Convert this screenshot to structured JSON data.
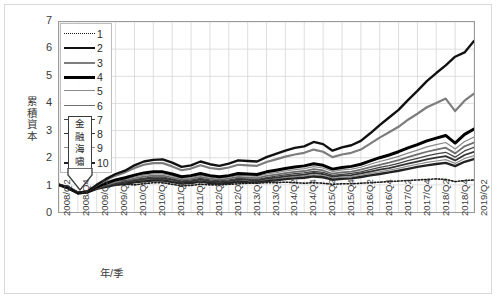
{
  "chart_data": {
    "type": "line",
    "title": "",
    "xlabel": "年/季",
    "ylabel": "累積資本",
    "ylim": [
      0,
      7
    ],
    "ytick_step": 1,
    "yticks": [
      "0",
      "1",
      "2",
      "3",
      "4",
      "5",
      "6",
      "7"
    ],
    "grid": true,
    "legend_position": "inside-top-left",
    "legend_entries": [
      "1",
      "2",
      "3",
      "4",
      "5",
      "6",
      "7",
      "8",
      "9",
      "10"
    ],
    "annotation": {
      "text": "金融海嘯",
      "chars": [
        "金",
        "融",
        "海",
        "嘯"
      ],
      "shape": "down-arrow-box",
      "at_x": "2008/Q4"
    },
    "categories": [
      "2008/Q2",
      "2008/Q3",
      "2008/Q4",
      "2009/Q1",
      "2009/Q2",
      "2009/Q3",
      "2009/Q4",
      "2010/Q1",
      "2010/Q2",
      "2010/Q3",
      "2010/Q4",
      "2011/Q1",
      "2011/Q2",
      "2011/Q3",
      "2011/Q4",
      "2012/Q1",
      "2012/Q2",
      "2012/Q3",
      "2012/Q4",
      "2013/Q1",
      "2013/Q2",
      "2013/Q3",
      "2013/Q4",
      "2014/Q1",
      "2014/Q2",
      "2014/Q3",
      "2014/Q4",
      "2015/Q1",
      "2015/Q2",
      "2015/Q3",
      "2015/Q4",
      "2016/Q1",
      "2016/Q2",
      "2016/Q3",
      "2016/Q4",
      "2017/Q1",
      "2017/Q2",
      "2017/Q3",
      "2017/Q4",
      "2018/Q1",
      "2018/Q2",
      "2018/Q3",
      "2018/Q4",
      "2019/Q1",
      "2019/Q2"
    ],
    "xtick_labels": [
      "2008/Q2",
      "2008/Q4",
      "2009/Q2",
      "2009/Q4",
      "2010/Q2",
      "2010/Q4",
      "2011/Q2",
      "2011/Q4",
      "2012/Q2",
      "2012/Q4",
      "2013/Q2",
      "2013/Q4",
      "2014/Q2",
      "2014/Q4",
      "2015/Q2",
      "2015/Q4",
      "2016/Q2",
      "2016/Q4",
      "2017/Q2",
      "2017/Q4",
      "2018/Q2",
      "2018/Q4",
      "2019/Q2"
    ],
    "series": [
      {
        "name": "1",
        "style": "dotted",
        "color": "#1a1a1a",
        "width": 1.6,
        "values": [
          1.0,
          0.92,
          0.74,
          0.76,
          0.88,
          0.96,
          1.0,
          1.02,
          1.0,
          1.04,
          1.08,
          1.08,
          1.02,
          0.96,
          0.98,
          1.02,
          1.0,
          1.0,
          1.02,
          1.04,
          1.06,
          1.06,
          1.08,
          1.08,
          1.1,
          1.08,
          1.06,
          1.08,
          1.06,
          1.02,
          1.04,
          1.04,
          1.06,
          1.08,
          1.1,
          1.12,
          1.14,
          1.16,
          1.18,
          1.2,
          1.22,
          1.2,
          1.12,
          1.16,
          1.18
        ]
      },
      {
        "name": "2",
        "style": "solid",
        "color": "#111111",
        "width": 2.4,
        "values": [
          1.0,
          0.9,
          0.7,
          0.76,
          1.0,
          1.22,
          1.4,
          1.52,
          1.72,
          1.86,
          1.92,
          1.94,
          1.82,
          1.66,
          1.72,
          1.86,
          1.76,
          1.7,
          1.78,
          1.9,
          1.88,
          1.86,
          2.02,
          2.14,
          2.26,
          2.36,
          2.42,
          2.58,
          2.5,
          2.26,
          2.38,
          2.46,
          2.62,
          2.9,
          3.2,
          3.48,
          3.76,
          4.12,
          4.46,
          4.82,
          5.12,
          5.4,
          5.72,
          5.88,
          6.3
        ]
      },
      {
        "name": "3",
        "style": "solid",
        "color": "#7d7d7d",
        "width": 2.2,
        "values": [
          1.0,
          0.9,
          0.71,
          0.76,
          0.98,
          1.18,
          1.34,
          1.46,
          1.62,
          1.74,
          1.8,
          1.8,
          1.68,
          1.54,
          1.6,
          1.72,
          1.62,
          1.58,
          1.64,
          1.74,
          1.72,
          1.7,
          1.84,
          1.94,
          2.04,
          2.12,
          2.18,
          2.3,
          2.22,
          2.02,
          2.12,
          2.18,
          2.3,
          2.52,
          2.74,
          2.94,
          3.14,
          3.4,
          3.62,
          3.86,
          4.02,
          4.18,
          3.72,
          4.1,
          4.36
        ]
      },
      {
        "name": "4",
        "style": "solid",
        "color": "#000000",
        "width": 3.0,
        "values": [
          1.0,
          0.89,
          0.7,
          0.74,
          0.92,
          1.06,
          1.18,
          1.26,
          1.36,
          1.44,
          1.48,
          1.48,
          1.4,
          1.3,
          1.34,
          1.42,
          1.34,
          1.3,
          1.34,
          1.42,
          1.4,
          1.38,
          1.48,
          1.54,
          1.6,
          1.66,
          1.7,
          1.78,
          1.72,
          1.58,
          1.64,
          1.68,
          1.76,
          1.88,
          2.0,
          2.1,
          2.22,
          2.36,
          2.48,
          2.62,
          2.72,
          2.82,
          2.54,
          2.86,
          3.06
        ]
      },
      {
        "name": "5",
        "style": "solid",
        "color": "#8a8a8a",
        "width": 1.2,
        "values": [
          1.0,
          0.89,
          0.7,
          0.74,
          0.9,
          1.02,
          1.13,
          1.2,
          1.29,
          1.36,
          1.4,
          1.4,
          1.33,
          1.24,
          1.27,
          1.35,
          1.28,
          1.24,
          1.28,
          1.35,
          1.33,
          1.31,
          1.4,
          1.45,
          1.51,
          1.56,
          1.6,
          1.67,
          1.62,
          1.49,
          1.55,
          1.58,
          1.65,
          1.76,
          1.86,
          1.95,
          2.05,
          2.17,
          2.28,
          2.4,
          2.48,
          2.56,
          2.32,
          2.6,
          2.76
        ]
      },
      {
        "name": "6",
        "style": "solid",
        "color": "#6e6e6e",
        "width": 1.8,
        "values": [
          1.0,
          0.89,
          0.7,
          0.74,
          0.89,
          1.0,
          1.1,
          1.16,
          1.24,
          1.3,
          1.34,
          1.34,
          1.27,
          1.19,
          1.22,
          1.29,
          1.23,
          1.19,
          1.23,
          1.29,
          1.27,
          1.25,
          1.33,
          1.38,
          1.43,
          1.48,
          1.51,
          1.58,
          1.53,
          1.41,
          1.46,
          1.49,
          1.56,
          1.65,
          1.74,
          1.82,
          1.91,
          2.02,
          2.12,
          2.22,
          2.3,
          2.37,
          2.16,
          2.42,
          2.56
        ]
      },
      {
        "name": "7",
        "style": "solid",
        "color": "#444444",
        "width": 1.3,
        "values": [
          1.0,
          0.88,
          0.7,
          0.73,
          0.88,
          0.98,
          1.07,
          1.13,
          1.2,
          1.25,
          1.29,
          1.29,
          1.22,
          1.15,
          1.18,
          1.24,
          1.18,
          1.15,
          1.18,
          1.24,
          1.22,
          1.2,
          1.27,
          1.32,
          1.37,
          1.41,
          1.44,
          1.5,
          1.46,
          1.35,
          1.39,
          1.42,
          1.48,
          1.56,
          1.64,
          1.71,
          1.79,
          1.89,
          1.98,
          2.07,
          2.14,
          2.2,
          2.02,
          2.25,
          2.38
        ]
      },
      {
        "name": "8",
        "style": "solid",
        "color": "#333333",
        "width": 1.8,
        "values": [
          1.0,
          0.88,
          0.7,
          0.73,
          0.87,
          0.96,
          1.04,
          1.1,
          1.16,
          1.21,
          1.24,
          1.24,
          1.18,
          1.11,
          1.14,
          1.2,
          1.14,
          1.11,
          1.14,
          1.2,
          1.18,
          1.16,
          1.23,
          1.27,
          1.31,
          1.35,
          1.38,
          1.44,
          1.4,
          1.3,
          1.34,
          1.36,
          1.42,
          1.49,
          1.56,
          1.62,
          1.7,
          1.78,
          1.86,
          1.94,
          2.0,
          2.06,
          1.9,
          2.1,
          2.22
        ]
      },
      {
        "name": "9",
        "style": "solid",
        "color": "#909090",
        "width": 1.2,
        "values": [
          1.0,
          0.88,
          0.7,
          0.73,
          0.86,
          0.95,
          1.02,
          1.07,
          1.13,
          1.17,
          1.2,
          1.2,
          1.14,
          1.08,
          1.11,
          1.16,
          1.11,
          1.08,
          1.11,
          1.16,
          1.14,
          1.12,
          1.18,
          1.22,
          1.26,
          1.3,
          1.32,
          1.38,
          1.34,
          1.25,
          1.28,
          1.3,
          1.36,
          1.42,
          1.48,
          1.54,
          1.61,
          1.69,
          1.76,
          1.83,
          1.88,
          1.93,
          1.79,
          1.97,
          2.08
        ]
      },
      {
        "name": "10",
        "style": "solid",
        "color": "#222222",
        "width": 2.4,
        "values": [
          1.0,
          0.87,
          0.69,
          0.72,
          0.85,
          0.93,
          1.0,
          1.04,
          1.09,
          1.13,
          1.16,
          1.16,
          1.1,
          1.05,
          1.07,
          1.12,
          1.07,
          1.05,
          1.07,
          1.12,
          1.1,
          1.09,
          1.14,
          1.17,
          1.21,
          1.24,
          1.26,
          1.31,
          1.28,
          1.19,
          1.22,
          1.24,
          1.29,
          1.35,
          1.4,
          1.46,
          1.52,
          1.59,
          1.66,
          1.72,
          1.77,
          1.81,
          1.69,
          1.85,
          1.95
        ]
      }
    ]
  },
  "legend": {
    "items": [
      {
        "label": "1"
      },
      {
        "label": "2"
      },
      {
        "label": "3"
      },
      {
        "label": "4"
      },
      {
        "label": "5"
      },
      {
        "label": "6"
      },
      {
        "label": "7"
      },
      {
        "label": "8"
      },
      {
        "label": "9"
      },
      {
        "label": "10"
      }
    ]
  },
  "colors": {
    "grid": "#d6d6d6",
    "axis": "#9b9b9b",
    "text": "#3a3a3a",
    "frame": "#d9d9d9"
  }
}
